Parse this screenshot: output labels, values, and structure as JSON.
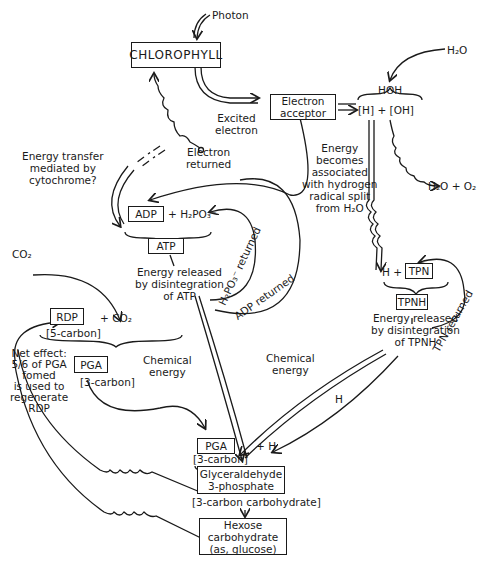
{
  "diagram": {
    "nodes": {
      "photon": "Photon",
      "chlorophyll": "CHLOROPHYLL",
      "excited_electron": [
        "Excited",
        "electron"
      ],
      "electron_returned": [
        "Electron",
        "returned"
      ],
      "electron_acceptor": [
        "Electron",
        "acceptor"
      ],
      "h2o_in": "H₂O",
      "hoh": "HOH",
      "h_oh": "[H] + [OH]",
      "h2o_o2": "H₂O + O₂",
      "energy_hydrogen": [
        "Energy",
        "becomes",
        "associated",
        "with hydrogen",
        "radical split",
        "from H₂O"
      ],
      "energy_transfer": [
        "Energy transfer",
        "mediated by",
        "cytochrome?"
      ],
      "adp": "ADP",
      "h2po3_plus": "+ H₂PO₃⁻",
      "atp": "ATP",
      "atp_release": [
        "Energy released",
        "by disintegration",
        "of ATP"
      ],
      "h2po3_returned": "H₂PO₃⁻ returned",
      "adp_returned": "ADP returned",
      "h_plus": "H +",
      "tpn": "TPN",
      "tpnh": "TPNH",
      "tpnh_release": [
        "Energy released",
        "by disintegration",
        "of TPNH"
      ],
      "tpn_returned": "TPN returned",
      "co2_in": "CO₂",
      "rdp": "RDP",
      "co2_plus": "+ CO₂",
      "five_carbon": "[5-carbon]",
      "net_effect": [
        "Net effect:",
        "5/6 of PGA",
        "fomed",
        "is used to",
        "regenerate",
        "RDP"
      ],
      "pga1": "PGA",
      "three_carbon1": "[3-carbon]",
      "chem_energy1": [
        "Chemical",
        "energy"
      ],
      "chem_energy2": [
        "Chemical",
        "energy"
      ],
      "h_label": "H",
      "pga2": "PGA",
      "plus_h": "+ H",
      "three_carbon2": "[3-carbon]",
      "glyceraldehyde": [
        "Glyceraldehyde",
        "3-phosphate"
      ],
      "three_carbon_carb": "[3-carbon carbohydrate]",
      "hexose": [
        "Hexose",
        "carbohydrate",
        "(as, glucose)"
      ]
    }
  }
}
